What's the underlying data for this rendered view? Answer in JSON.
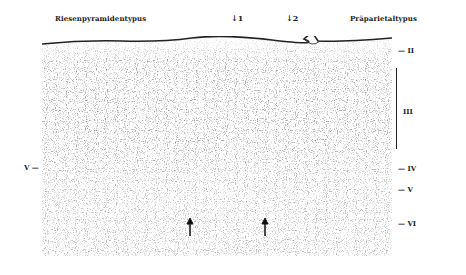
{
  "figure": {
    "left_title": "Riesenpyramidentypus",
    "right_title": "Präparietaltypus",
    "marker_1": "↓1",
    "marker_2": "↓2",
    "left_layer_label": "V —",
    "right_layers": [
      {
        "label": "— II",
        "y": 46
      },
      {
        "label": "III",
        "y": 107
      },
      {
        "label": "— IV",
        "y": 164
      },
      {
        "label": "— V",
        "y": 185
      },
      {
        "label": "— VI",
        "y": 219
      }
    ],
    "arrows": [
      {
        "x": 190
      },
      {
        "x": 265
      }
    ],
    "colors": {
      "ink": "#222222",
      "background": "#ffffff"
    }
  }
}
